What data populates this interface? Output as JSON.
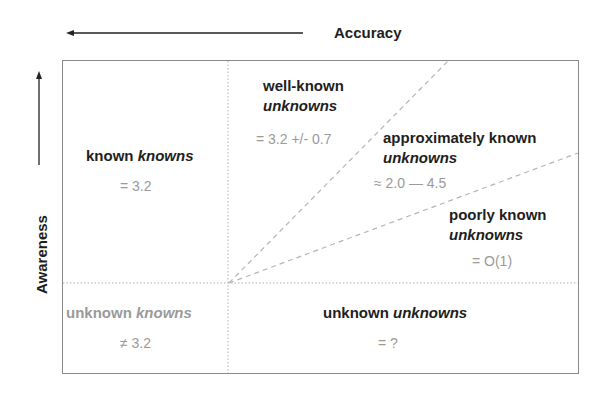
{
  "axes": {
    "x": {
      "label": "Accuracy",
      "arrow_direction": "left"
    },
    "y": {
      "label": "Awareness",
      "arrow_direction": "up"
    }
  },
  "quadrants": {
    "known_knowns": {
      "label_regular": "known ",
      "label_italic": "knowns",
      "value": "= 3.2"
    },
    "well_known_unknowns": {
      "label_regular": "well-known",
      "label_italic": "unknowns",
      "value": "= 3.2 +/- 0.7"
    },
    "approximately_known_unknowns": {
      "label_regular": "approximately known",
      "label_italic": "unknowns",
      "value": "≈ 2.0 — 4.5"
    },
    "poorly_known_unknowns": {
      "label_regular": "poorly known",
      "label_italic": "unknowns",
      "value": "= O(1)"
    },
    "unknown_knowns": {
      "label_regular": "unknown ",
      "label_italic": "knowns",
      "value": "≠ 3.2"
    },
    "unknown_unknowns": {
      "label_regular": "unknown ",
      "label_italic": "unknowns",
      "value": "= ?"
    }
  },
  "colors": {
    "label": "#1e1e1e",
    "value": "#9a9a9a",
    "border": "#8a8a8a",
    "divider": "#b0b0b0"
  }
}
